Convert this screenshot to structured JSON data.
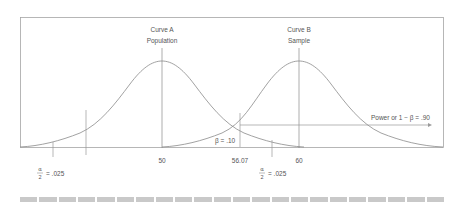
{
  "diagram": {
    "curve_a": {
      "line1": "Curve A",
      "line2": "Population",
      "mean_label": "50"
    },
    "curve_b": {
      "line1": "Curve B",
      "line2": "Sample",
      "mean_label": "60"
    },
    "critical_value_label": "56.07",
    "beta_label": "β = .10",
    "power_label": "Power or 1 − β = .90",
    "alpha_left": {
      "num": "α",
      "den": "2",
      "value": "= .025"
    },
    "alpha_right": {
      "num": "α",
      "den": "2",
      "value": "= .025"
    },
    "colors": {
      "curve": "#8a8a8a",
      "frame": "#9a9a9a",
      "footer": "#c9c9c9"
    }
  },
  "footer": {
    "block_count": 22
  }
}
